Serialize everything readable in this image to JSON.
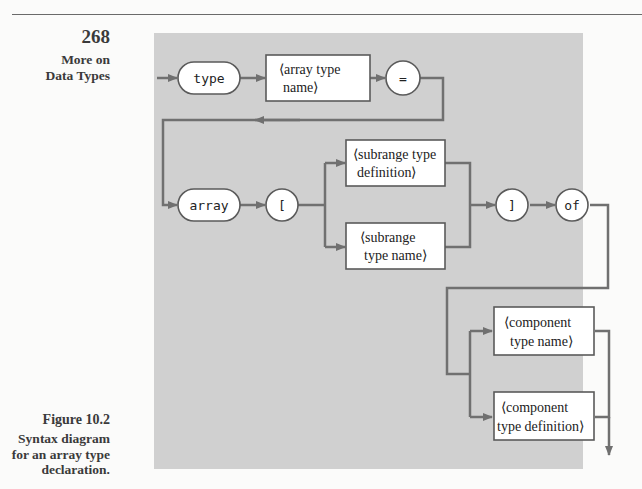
{
  "page": {
    "page_number": "268",
    "section_title_line1": "More on",
    "section_title_line2": "Data Types"
  },
  "figure": {
    "label": "Figure 10.2",
    "caption_line1": "Syntax diagram",
    "caption_line2": "for an array type",
    "caption_line3": "declaration."
  },
  "diagram": {
    "type": "syntax-diagram",
    "colors": {
      "panel_bg": "#d0d0d0",
      "line": "#707070",
      "node_fill": "#ffffff",
      "node_border": "#5a5a5a"
    },
    "nodes": {
      "type_kw": "type",
      "array_type_name_l1": "⟨array type",
      "array_type_name_l2": "name⟩",
      "equals": "=",
      "array_kw": "array",
      "lbracket": "[",
      "subrange_def_l1": "⟨subrange type",
      "subrange_def_l2": "definition⟩",
      "subrange_name_l1": "⟨subrange",
      "subrange_name_l2": "type name⟩",
      "rbracket": "]",
      "of_kw": "of",
      "component_name_l1": "⟨component",
      "component_name_l2": "type name⟩",
      "component_def_l1": "⟨component",
      "component_def_l2": "type definition⟩"
    },
    "edges": [
      [
        "start",
        "type"
      ],
      [
        "type",
        "⟨array type name⟩"
      ],
      [
        "⟨array type name⟩",
        "="
      ],
      [
        "=",
        "array"
      ],
      [
        "array",
        "["
      ],
      [
        "[",
        "⟨subrange type definition⟩"
      ],
      [
        "[",
        "⟨subrange type name⟩"
      ],
      [
        "⟨subrange type definition⟩",
        "]"
      ],
      [
        "⟨subrange type name⟩",
        "]"
      ],
      [
        "]",
        "of"
      ],
      [
        "of",
        "⟨component type name⟩"
      ],
      [
        "of",
        "⟨component type definition⟩"
      ],
      [
        "⟨component type name⟩",
        "end"
      ],
      [
        "⟨component type definition⟩",
        "end"
      ]
    ]
  }
}
